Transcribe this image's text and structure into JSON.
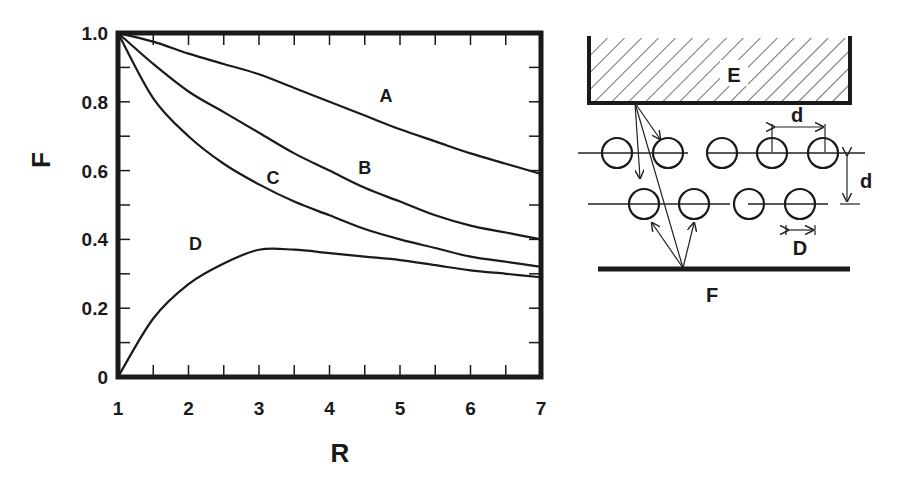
{
  "chart_data": {
    "type": "line",
    "title": "",
    "xlabel": "R",
    "ylabel": "F",
    "xlim": [
      1,
      7
    ],
    "ylim": [
      0,
      1.0
    ],
    "x_ticks": [
      "1",
      "2",
      "3",
      "4",
      "5",
      "6",
      "7"
    ],
    "y_ticks": [
      "0",
      "0.2",
      "0.4",
      "0.6",
      "0.8",
      "1.0"
    ],
    "grid": false,
    "legend": "inline curve labels",
    "x": [
      1,
      1.5,
      2,
      2.5,
      3,
      3.5,
      4,
      4.5,
      5,
      5.5,
      6,
      6.5,
      7
    ],
    "series": [
      {
        "name": "A",
        "values": [
          1.0,
          0.975,
          0.94,
          0.91,
          0.88,
          0.84,
          0.8,
          0.76,
          0.72,
          0.685,
          0.65,
          0.62,
          0.59
        ]
      },
      {
        "name": "B",
        "values": [
          1.0,
          0.91,
          0.83,
          0.77,
          0.71,
          0.65,
          0.6,
          0.55,
          0.51,
          0.47,
          0.44,
          0.42,
          0.4
        ]
      },
      {
        "name": "C",
        "values": [
          1.0,
          0.81,
          0.7,
          0.62,
          0.56,
          0.51,
          0.47,
          0.43,
          0.4,
          0.375,
          0.35,
          0.335,
          0.32
        ]
      },
      {
        "name": "D",
        "values": [
          0.0,
          0.17,
          0.27,
          0.33,
          0.37,
          0.37,
          0.36,
          0.35,
          0.34,
          0.325,
          0.31,
          0.3,
          0.29
        ]
      }
    ],
    "annotations": [
      {
        "text": "A",
        "x": 4.8,
        "y": 0.8
      },
      {
        "text": "B",
        "x": 4.5,
        "y": 0.59
      },
      {
        "text": "C",
        "x": 3.2,
        "y": 0.56
      },
      {
        "text": "D",
        "x": 2.1,
        "y": 0.37
      }
    ]
  },
  "diagram": {
    "labels": {
      "emitter": "E",
      "floor": "F",
      "pitch": "d",
      "row_spacing": "d",
      "diameter": "D"
    }
  }
}
